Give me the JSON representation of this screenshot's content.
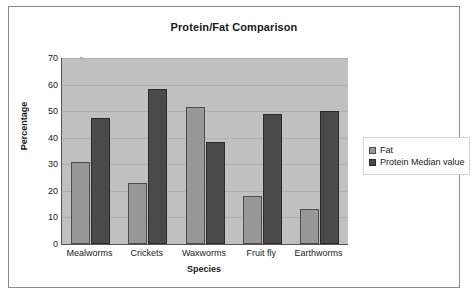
{
  "chart_data": {
    "type": "bar",
    "title": "Protein/Fat Comparison",
    "xlabel": "Species",
    "ylabel": "Percentage",
    "categories": [
      "Mealworms",
      "Crickets",
      "Waxworms",
      "Fruit fly",
      "Earthworms"
    ],
    "series": [
      {
        "name": "Fat",
        "color": "#989898",
        "values": [
          31,
          23,
          51.5,
          18,
          13
        ]
      },
      {
        "name": "Protein Median value",
        "color": "#4a4a4a",
        "values": [
          47.5,
          58.5,
          38.5,
          49,
          50
        ]
      }
    ],
    "ylim": [
      0,
      70
    ],
    "yticks": [
      0,
      10,
      20,
      30,
      40,
      50,
      60,
      70
    ],
    "ytick_labels": [
      "0",
      "10",
      "20",
      "30",
      "40",
      "50",
      "60",
      "70"
    ],
    "grid": true,
    "legend_position": "right",
    "plot_background": "#c0c0c0",
    "chart_background": "#ffffff"
  }
}
